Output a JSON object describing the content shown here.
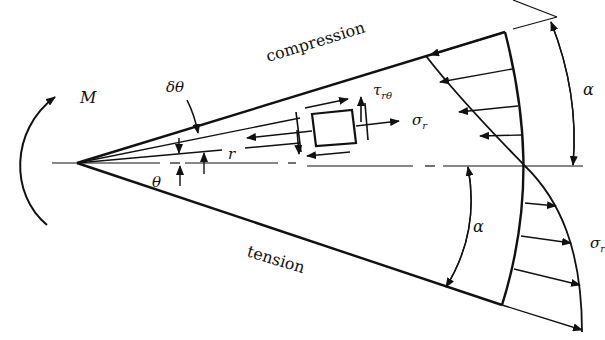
{
  "diagram": {
    "labels": {
      "moment": "M",
      "delta_theta": "δθ",
      "compression": "compression",
      "tension": "tension",
      "tau": "τ",
      "tau_sub": "rθ",
      "sigma_element": "σ",
      "sigma_element_sub": "r",
      "radius": "r",
      "theta": "θ",
      "alpha_top": "α",
      "alpha_bottom": "α",
      "sigma_distribution": "σ",
      "sigma_distribution_sub": "r"
    },
    "colors": {
      "stroke": "#111111",
      "background": "#ffffff"
    }
  }
}
